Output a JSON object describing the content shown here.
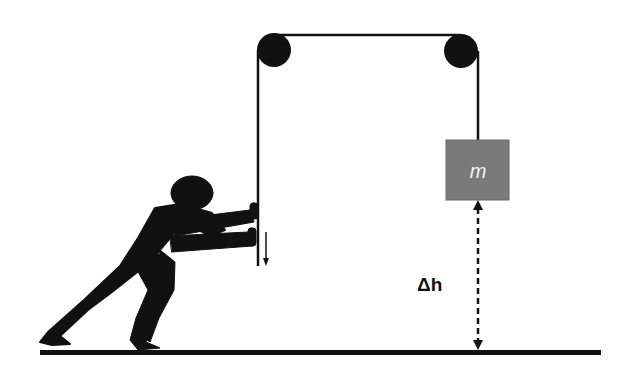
{
  "diagram": {
    "type": "pulley-system",
    "mass": {
      "label": "m",
      "fill": "#7a7a7a"
    },
    "height_label": "Δh",
    "pulleys": [
      {
        "name": "left-pulley",
        "cx": 275,
        "cy": 50,
        "r": 17
      },
      {
        "name": "right-pulley",
        "cx": 461,
        "cy": 51,
        "r": 17
      }
    ],
    "force_arrow": {
      "direction": "down"
    },
    "colors": {
      "ink": "#111111",
      "mass": "#7a7a7a",
      "background": "#ffffff"
    }
  }
}
